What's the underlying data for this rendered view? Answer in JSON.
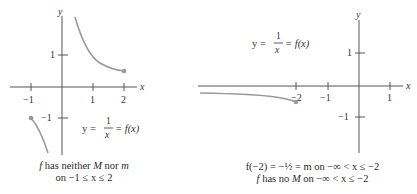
{
  "left_graph": {
    "axis_labels": {
      "x": "x",
      "y": "y"
    },
    "x_ticks": [
      {
        "value": -1,
        "label": "−1"
      },
      {
        "value": 1,
        "label": "1"
      },
      {
        "value": 2,
        "label": "2"
      }
    ],
    "y_ticks": [
      {
        "value": 1,
        "label": "1"
      },
      {
        "value": -1,
        "label": "−1"
      }
    ],
    "equation": {
      "lhs": "y =",
      "num": "1",
      "den": "x",
      "rhs": "= f(x)"
    },
    "caption": {
      "line1_prefix": "f",
      "line1_mid": " has neither ",
      "line1_M": "M",
      "line1_nor": " nor ",
      "line1_m": "m",
      "line2": "on  −1 ≤ x ≤ 2"
    },
    "curve_color": "#999999",
    "endpoints": [
      {
        "x": -1,
        "y": -1,
        "closed": true
      },
      {
        "x": 2,
        "y": 0.5,
        "closed": true
      }
    ]
  },
  "right_graph": {
    "axis_labels": {
      "x": "x",
      "y": "y"
    },
    "x_ticks": [
      {
        "value": -2,
        "label": "−2"
      },
      {
        "value": -1,
        "label": "−1"
      },
      {
        "value": 1,
        "label": "1"
      }
    ],
    "y_ticks": [
      {
        "value": 1,
        "label": "1"
      },
      {
        "value": -1,
        "label": "−1"
      }
    ],
    "equation": {
      "lhs": "y =",
      "num": "1",
      "den": "x",
      "rhs": "= f(x)"
    },
    "caption": {
      "line1": "f(−2) = −½ = m on  −∞ < x ≤ −2",
      "line2_prefix": "f",
      "line2_mid": " has no ",
      "line2_M": "M",
      "line2_rest": " on  −∞ < x ≤ −2"
    },
    "curve_color": "#999999",
    "endpoints": [
      {
        "x": -2,
        "y": -0.5,
        "closed": true
      }
    ]
  }
}
